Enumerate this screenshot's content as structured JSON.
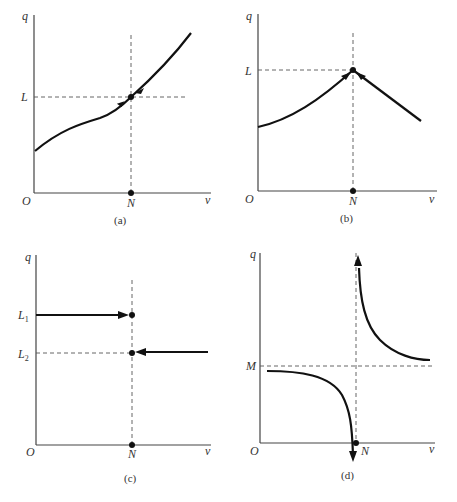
{
  "panels": [
    {
      "id": "a",
      "caption": "(a)",
      "y_axis_label": "q",
      "x_axis_label": "v",
      "origin_label": "O",
      "x_marker_label": "N",
      "y_marker_labels": [
        "L"
      ],
      "description": "Increasing curve crossing equilibrium point (N, L); arrows point toward the point from both sides (stable)"
    },
    {
      "id": "b",
      "caption": "(b)",
      "y_axis_label": "q",
      "x_axis_label": "v",
      "origin_label": "O",
      "x_marker_label": "N",
      "y_marker_labels": [
        "L"
      ],
      "description": "Curve rising to peak at (N, L) then falling linearly; arrows point toward the peak from both sides"
    },
    {
      "id": "c",
      "caption": "(c)",
      "y_axis_label": "q",
      "x_axis_label": "v",
      "origin_label": "O",
      "x_marker_label": "N",
      "y_marker_labels": [
        "L1",
        "L2"
      ],
      "description": "Horizontal arrow at L1 from left ending at N; horizontal arrow at L2 from right ending at N (jump discontinuity)"
    },
    {
      "id": "d",
      "caption": "(d)",
      "y_axis_label": "q",
      "x_axis_label": "v",
      "origin_label": "O",
      "x_marker_label": "N",
      "y_marker_labels": [
        "M"
      ],
      "description": "Hyperbola-like curve with vertical asymptote at N; left branch near M diving down, right branch shooting up, horizontal asymptote M"
    }
  ]
}
